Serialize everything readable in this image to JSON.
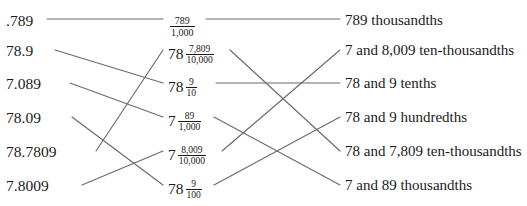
{
  "figure": {
    "kind": "matching-diagram",
    "colors": {
      "background": "#ffffff",
      "text": "#1a1a1a",
      "line": "#6b6b6b"
    }
  },
  "columns": {
    "decimals": [
      {
        "id": "L1",
        "text": ".789"
      },
      {
        "id": "L2",
        "text": "78.9"
      },
      {
        "id": "L3",
        "text": "7.089"
      },
      {
        "id": "L4",
        "text": "78.09"
      },
      {
        "id": "L5",
        "text": "78.7809"
      },
      {
        "id": "L6",
        "text": "7.8009"
      }
    ],
    "fractions": [
      {
        "id": "M1",
        "whole": "",
        "numerator": "789",
        "denominator": "1,000"
      },
      {
        "id": "M2",
        "whole": "78",
        "numerator": "7,809",
        "denominator": "10,000"
      },
      {
        "id": "M3",
        "whole": "78",
        "numerator": "9",
        "denominator": "10"
      },
      {
        "id": "M4",
        "whole": "7",
        "numerator": "89",
        "denominator": "1,000"
      },
      {
        "id": "M5",
        "whole": "7",
        "numerator": "8,009",
        "denominator": "10,000"
      },
      {
        "id": "M6",
        "whole": "78",
        "numerator": "9",
        "denominator": "100"
      }
    ],
    "words": [
      {
        "id": "R1",
        "text": "789 thousandths"
      },
      {
        "id": "R2",
        "text": "7 and 8,009 ten-thousandths"
      },
      {
        "id": "R3",
        "text": "78 and 9 tenths"
      },
      {
        "id": "R4",
        "text": "78 and 9 hundredths"
      },
      {
        "id": "R5",
        "text": "78 and 7,809 ten-thousandths"
      },
      {
        "id": "R6",
        "text": "7 and 89 thousandths"
      }
    ]
  },
  "connections": [
    {
      "from": "L1",
      "to": "M1"
    },
    {
      "from": "L2",
      "to": "M3"
    },
    {
      "from": "L3",
      "to": "M4"
    },
    {
      "from": "L4",
      "to": "M6"
    },
    {
      "from": "L5",
      "to": "M2"
    },
    {
      "from": "L6",
      "to": "M5"
    },
    {
      "from": "M1",
      "to": "R1"
    },
    {
      "from": "M3",
      "to": "R3"
    },
    {
      "from": "M4",
      "to": "R6"
    },
    {
      "from": "M6",
      "to": "R4"
    },
    {
      "from": "M2",
      "to": "R5"
    },
    {
      "from": "M5",
      "to": "R2"
    }
  ]
}
